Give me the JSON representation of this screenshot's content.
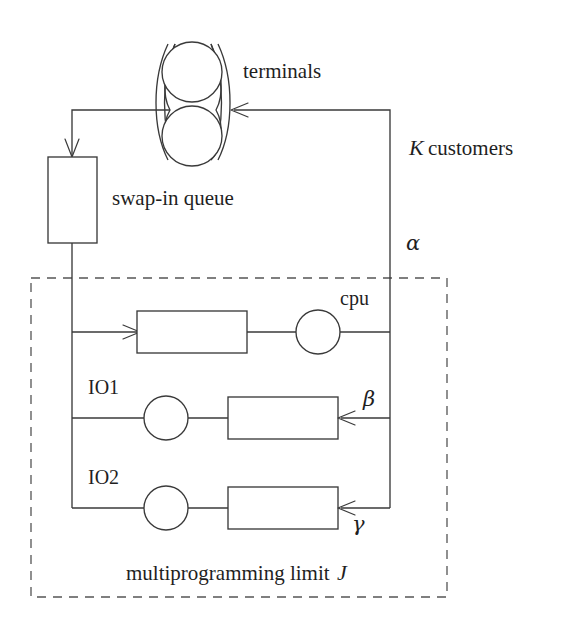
{
  "diagram": {
    "type": "queueing-network",
    "title_text": "",
    "colors": {
      "line": "#3a3a3a",
      "dashed": "#555555",
      "text": "#1f1f1f",
      "background": "#ffffff"
    },
    "labels": {
      "terminals": "terminals",
      "k_customers": "K customers",
      "k_symbol": "K",
      "customers_word": "customers",
      "swap_in_queue": "swap-in queue",
      "cpu": "cpu",
      "io1": "IO1",
      "io2": "IO2",
      "alpha": "α",
      "beta": "β",
      "gamma": "γ",
      "mpl_text": "multiprogramming limit",
      "mpl_symbol": "J",
      "mpl_full": "multiprogramming limit J"
    },
    "nodes": [
      {
        "name": "terminals",
        "shape": "terminals-group",
        "label": "terminals",
        "circles": 2
      },
      {
        "name": "swap-in-queue",
        "shape": "rectangle",
        "label": "swap-in queue"
      },
      {
        "name": "cpu-station",
        "shape": "queue-plus-server",
        "label": "cpu"
      },
      {
        "name": "io1-station",
        "shape": "server-plus-queue",
        "label": "IO1"
      },
      {
        "name": "io2-station",
        "shape": "server-plus-queue",
        "label": "IO2"
      }
    ],
    "flows": [
      {
        "name": "terminals-to-swap-in",
        "from": "terminals",
        "to": "swap-in-queue",
        "rate": ""
      },
      {
        "name": "swap-in-to-cpu",
        "from": "swap-in-queue",
        "to": "cpu-station",
        "rate": ""
      },
      {
        "name": "cpu-to-terminals",
        "from": "cpu-station",
        "to": "terminals",
        "rate": "α"
      },
      {
        "name": "cpu-to-io1",
        "from": "cpu-station",
        "to": "io1-station",
        "rate": "β"
      },
      {
        "name": "cpu-to-io2",
        "from": "cpu-station",
        "to": "io2-station",
        "rate": "γ"
      }
    ],
    "container": {
      "name": "multiprogramming-limit-box",
      "style": "dashed",
      "label": "multiprogramming limit J"
    }
  }
}
